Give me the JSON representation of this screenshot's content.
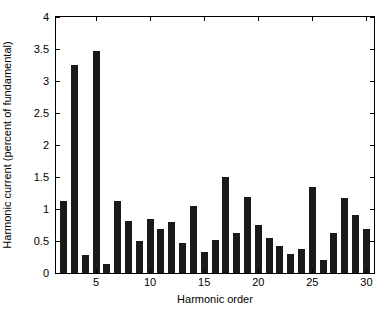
{
  "chart_data": {
    "type": "bar",
    "title": "",
    "xlabel": "Harmonic order",
    "ylabel": "Harmonic current (percent of fundamental)",
    "xlim": [
      1.3,
      30.7
    ],
    "ylim": [
      0,
      4
    ],
    "grid": false,
    "legend": null,
    "bar_color": "#1a1a1a",
    "background_color": "#ffffff",
    "axis_color": "#000000",
    "xticks": [
      5,
      10,
      15,
      20,
      25,
      30
    ],
    "xticklabels": [
      "5",
      "10",
      "15",
      "20",
      "25",
      "30"
    ],
    "yticks": [
      0,
      0.5,
      1,
      1.5,
      2,
      2.5,
      3,
      3.5,
      4
    ],
    "yticklabels": [
      "0",
      "0.5",
      "1",
      "1.5",
      "2",
      "2.5",
      "3",
      "3.5",
      "4"
    ],
    "categories": [
      2,
      3,
      4,
      5,
      6,
      7,
      8,
      9,
      10,
      11,
      12,
      13,
      14,
      15,
      16,
      17,
      18,
      19,
      20,
      21,
      22,
      23,
      24,
      25,
      26,
      27,
      28,
      29,
      30
    ],
    "values": [
      1.12,
      3.25,
      0.28,
      3.47,
      0.14,
      1.12,
      0.82,
      0.5,
      0.85,
      0.68,
      0.8,
      0.47,
      1.05,
      0.33,
      0.52,
      1.5,
      0.62,
      1.18,
      0.75,
      0.55,
      0.42,
      0.3,
      0.37,
      1.35,
      0.21,
      0.62,
      1.17,
      0.9,
      0.68
    ],
    "value_unit": "percent of fundamental"
  }
}
